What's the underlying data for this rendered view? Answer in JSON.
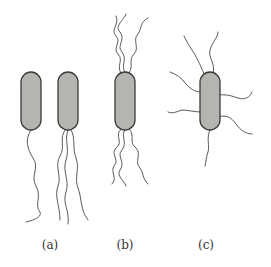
{
  "figure": {
    "type": "bacterial flagella arrangement diagram",
    "panels": [
      {
        "id": "a",
        "label": "(a)",
        "description": "monotrichous and lophotrichous (polar flagella)",
        "cells": 2
      },
      {
        "id": "b",
        "label": "(b)",
        "description": "amphitrichous (tufts at both poles)",
        "cells": 1
      },
      {
        "id": "c",
        "label": "(c)",
        "description": "peritrichous (flagella all around)",
        "cells": 1
      }
    ]
  },
  "colors": {
    "cell_fill": "#b4b4b0",
    "cell_stroke": "#3a3a3a",
    "flagella": "#5a5a5a",
    "background": "#ffffff"
  }
}
